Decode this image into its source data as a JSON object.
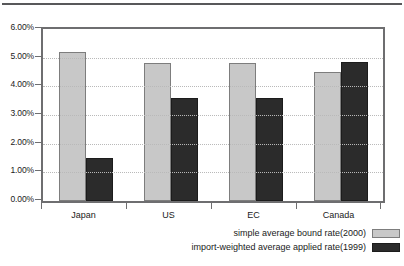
{
  "chart_data": {
    "type": "bar",
    "title": "",
    "xlabel": "",
    "ylabel": "",
    "categories": [
      "Japan",
      "US",
      "EC",
      "Canada"
    ],
    "series": [
      {
        "name": "simple average bound rate(2000)",
        "color": "#c8c8c8",
        "values": [
          5.2,
          4.8,
          4.8,
          4.5
        ]
      },
      {
        "name": "import-weighted average applied rate(1999)",
        "color": "#2b2b2b",
        "values": [
          1.5,
          3.6,
          3.6,
          4.85
        ]
      }
    ],
    "ylim": [
      0,
      6
    ],
    "ytick_values": [
      0,
      1,
      2,
      3,
      4,
      5,
      6
    ],
    "ytick_labels": [
      "0.00%",
      "1.00%",
      "2.00%",
      "3.00%",
      "4.00%",
      "5.00%",
      "6.00%"
    ],
    "grid": true,
    "grid_axis": "y",
    "grid_style": "dotted",
    "legend_position": "bottom-right"
  },
  "legend": {
    "items": [
      {
        "label": "simple average bound rate(2000)",
        "swatch": "light"
      },
      {
        "label": "import-weighted average applied rate(1999)",
        "swatch": "dark"
      }
    ]
  }
}
